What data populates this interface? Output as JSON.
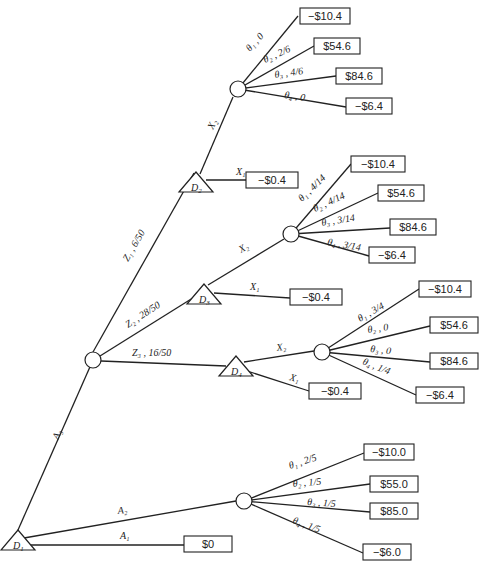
{
  "diagram": {
    "type": "decision-tree",
    "decision_nodes": [
      {
        "id": "D1",
        "label": "D",
        "sub": "1",
        "x": 18,
        "y": 540
      },
      {
        "id": "D2",
        "label": "D",
        "sub": "2",
        "x": 196,
        "y": 182
      },
      {
        "id": "D3",
        "label": "D",
        "sub": "3",
        "x": 204,
        "y": 294
      },
      {
        "id": "D4",
        "label": "D",
        "sub": "4",
        "x": 236,
        "y": 366
      }
    ],
    "chance_nodes": [
      {
        "id": "C_D2",
        "x": 238,
        "y": 89
      },
      {
        "id": "C_Z",
        "x": 93,
        "y": 360
      },
      {
        "id": "C_D3",
        "x": 291,
        "y": 234
      },
      {
        "id": "C_D4",
        "x": 322,
        "y": 352
      },
      {
        "id": "C_A2",
        "x": 244,
        "y": 501
      }
    ],
    "edges": [
      {
        "from": [
          18,
          530
        ],
        "to": [
          93,
          360
        ],
        "label": "A₃",
        "lx": 58,
        "ly": 440,
        "rot": -66
      },
      {
        "from": [
          24,
          538
        ],
        "to": [
          236,
          501
        ],
        "label": "A₂",
        "lx": 118,
        "ly": 514,
        "rot": -6
      },
      {
        "from": [
          28,
          545
        ],
        "to": [
          184,
          545
        ],
        "label": "A₁",
        "lx": 120,
        "ly": 539,
        "rot": 0
      },
      {
        "from": [
          93,
          352
        ],
        "to": [
          194,
          173
        ],
        "label": "Z₁ , 6/50",
        "lx": 128,
        "ly": 262,
        "rot": -60
      },
      {
        "from": [
          100,
          356
        ],
        "to": [
          196,
          296
        ],
        "label": "Z₂ , 28/50",
        "lx": 128,
        "ly": 328,
        "rot": -33
      },
      {
        "from": [
          101,
          361
        ],
        "to": [
          226,
          366
        ],
        "label": "Z₃ , 16/50",
        "lx": 132,
        "ly": 356,
        "rot": 0
      },
      {
        "from": [
          200,
          174
        ],
        "to": [
          233,
          97
        ],
        "label": "X₂",
        "lx": 213,
        "ly": 130,
        "rot": -64
      },
      {
        "from": [
          206,
          180
        ],
        "to": [
          246,
          180
        ],
        "label": "X₁",
        "lx": 236,
        "ly": 175,
        "rot": 0
      },
      {
        "from": [
          208,
          285
        ],
        "to": [
          284,
          239
        ],
        "label": "X₂",
        "lx": 241,
        "ly": 253,
        "rot": -30
      },
      {
        "from": [
          214,
          293
        ],
        "to": [
          290,
          298
        ],
        "label": "X₁",
        "lx": 250,
        "ly": 290,
        "rot": 0
      },
      {
        "from": [
          244,
          362
        ],
        "to": [
          314,
          351
        ],
        "label": "X₂",
        "lx": 277,
        "ly": 351,
        "rot": -8
      },
      {
        "from": [
          244,
          370
        ],
        "to": [
          309,
          391
        ],
        "label": "X₁",
        "lx": 289,
        "ly": 380,
        "rot": 15
      }
    ],
    "chance_branches": [
      {
        "node": "C_D2",
        "branches": [
          {
            "label": "θ₁ , 0",
            "to": [
              298,
              16
            ],
            "lx": 250,
            "ly": 52,
            "rot": -48,
            "payoff": "−$10.4",
            "bx": 300,
            "by": 8,
            "bw": 50
          },
          {
            "label": "θ₂ , 2/6",
            "to": [
              314,
              46
            ],
            "lx": 265,
            "ly": 63,
            "rot": -24,
            "payoff": "$54.6",
            "bx": 314,
            "by": 38,
            "bw": 46
          },
          {
            "label": "θ₃ , 4/6",
            "to": [
              336,
              76
            ],
            "lx": 275,
            "ly": 78,
            "rot": -8,
            "payoff": "$84.6",
            "bx": 336,
            "by": 68,
            "bw": 46
          },
          {
            "label": "θ₄ , 0",
            "to": [
              346,
              107
            ],
            "lx": 284,
            "ly": 98,
            "rot": 8,
            "payoff": "−$6.4",
            "bx": 346,
            "by": 98,
            "bw": 46
          }
        ]
      },
      {
        "node": "C_D3",
        "branches": [
          {
            "label": "θ₁ , 4/14",
            "to": [
              351,
              164
            ],
            "lx": 302,
            "ly": 202,
            "rot": -44,
            "payoff": "−$10.4",
            "bx": 351,
            "by": 156,
            "bw": 54
          },
          {
            "label": "θ₂ , 4/14",
            "to": [
              378,
              193
            ],
            "lx": 315,
            "ly": 212,
            "rot": -25,
            "payoff": "$54.6",
            "bx": 378,
            "by": 185,
            "bw": 46
          },
          {
            "label": "θ₃ , 3/14",
            "to": [
              390,
              228
            ],
            "lx": 322,
            "ly": 226,
            "rot": -9,
            "payoff": "$84.6",
            "bx": 390,
            "by": 219,
            "bw": 46
          },
          {
            "label": "θ₄ , 3/14",
            "to": [
              369,
              256
            ],
            "lx": 327,
            "ly": 245,
            "rot": 10,
            "payoff": "−$6.4",
            "bx": 369,
            "by": 247,
            "bw": 46
          }
        ]
      },
      {
        "node": "C_D4",
        "branches": [
          {
            "label": "θ₁ , 3/4",
            "to": [
              419,
              289
            ],
            "lx": 360,
            "ly": 322,
            "rot": -30,
            "payoff": "−$10.4",
            "bx": 419,
            "by": 281,
            "bw": 52
          },
          {
            "label": "θ₂ , 0",
            "to": [
              430,
              326
            ],
            "lx": 368,
            "ly": 333,
            "rot": -8,
            "payoff": "$54.6",
            "bx": 430,
            "by": 317,
            "bw": 48
          },
          {
            "label": "θ₃ , 0",
            "to": [
              430,
              362
            ],
            "lx": 370,
            "ly": 352,
            "rot": 6,
            "payoff": "$84.6",
            "bx": 430,
            "by": 353,
            "bw": 48
          },
          {
            "label": "θ₄ , 1/4",
            "to": [
              416,
              395
            ],
            "lx": 362,
            "ly": 364,
            "rot": 22,
            "payoff": "−$6.4",
            "bx": 416,
            "by": 387,
            "bw": 48
          }
        ]
      },
      {
        "node": "C_A2",
        "branches": [
          {
            "label": "θ₁ , 2/5",
            "to": [
              364,
              453
            ],
            "lx": 290,
            "ly": 469,
            "rot": -18,
            "payoff": "−$10.0",
            "bx": 364,
            "by": 444,
            "bw": 50
          },
          {
            "label": "θ₂ , 1/5",
            "to": [
              370,
              484
            ],
            "lx": 293,
            "ly": 487,
            "rot": -5,
            "payoff": "$55.0",
            "bx": 370,
            "by": 476,
            "bw": 48
          },
          {
            "label": "θ₃ , 1/5",
            "to": [
              370,
              512
            ],
            "lx": 307,
            "ly": 505,
            "rot": 4,
            "payoff": "$85.0",
            "bx": 370,
            "by": 503,
            "bw": 48
          },
          {
            "label": "θ₄ , 1/5",
            "to": [
              363,
              553
            ],
            "lx": 292,
            "ly": 523,
            "rot": 20,
            "payoff": "−$6.0",
            "bx": 363,
            "by": 544,
            "bw": 48
          }
        ]
      }
    ],
    "terminal_payoffs": [
      {
        "id": "D2_X1",
        "payoff": "−$0.4",
        "bx": 246,
        "by": 172,
        "bw": 52
      },
      {
        "id": "D3_X1",
        "payoff": "−$0.4",
        "bx": 290,
        "by": 289,
        "bw": 52
      },
      {
        "id": "D4_X1",
        "payoff": "−$0.4",
        "bx": 309,
        "by": 383,
        "bw": 52
      },
      {
        "id": "D1_A1",
        "payoff": "$0",
        "bx": 184,
        "by": 536,
        "bw": 48
      }
    ]
  }
}
